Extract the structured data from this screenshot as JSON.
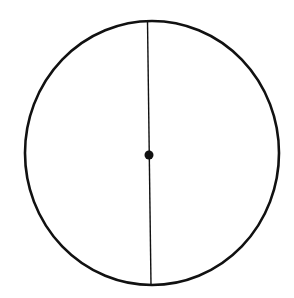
{
  "diagram": {
    "title": "",
    "background": "#ffffff",
    "stroke_color": "#111111",
    "circle": {
      "cx": 152,
      "cy": 153,
      "rx": 127,
      "ry": 132,
      "stroke_width": 2.6
    },
    "diameter": {
      "x1": 147.5,
      "y1": 21,
      "x2": 151,
      "y2": 285,
      "stroke_width": 1.4
    },
    "center_point": {
      "cx": 149,
      "cy": 155,
      "r": 4.5
    }
  }
}
